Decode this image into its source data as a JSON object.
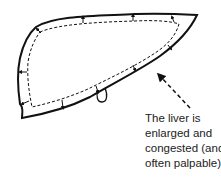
{
  "diagram": {
    "subject": "liver",
    "caption_lines": [
      "The liver is",
      "enlarged and",
      "congested (and",
      "often palpable)"
    ],
    "colors": {
      "stroke": "#111111",
      "text": "#222222",
      "background": "#ffffff"
    },
    "elements": {
      "outer_outline": "enlarged liver outline (solid)",
      "inner_outline": "normal liver outline (dashed)",
      "expansion_arrows": "small arrows pointing outward from dashed to solid outline",
      "gallbladder": "small loop at lower edge",
      "pointer_arrow": "dashed arrow from caption to liver"
    }
  }
}
